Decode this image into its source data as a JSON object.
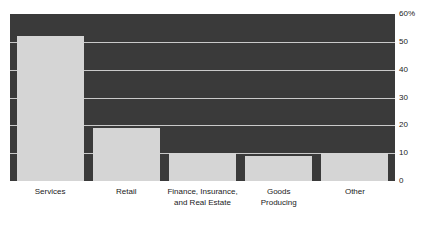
{
  "figure": {
    "title_remnant": "",
    "background_color": "#ffffff",
    "plot_background_color": "#3a3a3a",
    "bar_color": "#d5d5d5",
    "gridline_color": "#c9c9c9",
    "text_color": "#1a1a1a"
  },
  "chart_data": {
    "type": "bar",
    "title": "",
    "xlabel": "",
    "ylabel": "",
    "categories": [
      "Services",
      "Retail",
      "Finance, Insurance,\nand Real Estate",
      "Goods\nProducing",
      "Other"
    ],
    "values": [
      52,
      19,
      10,
      9,
      10
    ],
    "ylim": [
      0,
      60
    ],
    "yticks": [
      0,
      10,
      20,
      30,
      40,
      50,
      60
    ],
    "ytick_labels": [
      "0",
      "10",
      "20",
      "30",
      "40",
      "50",
      "60%"
    ],
    "y_unit": "%",
    "grid": true,
    "grid_axis": "y",
    "legend": false,
    "legend_position": "none",
    "orientation": "vertical",
    "series": [
      {
        "name": "Share of establishments",
        "values": [
          52,
          19,
          10,
          9,
          10
        ]
      }
    ]
  }
}
